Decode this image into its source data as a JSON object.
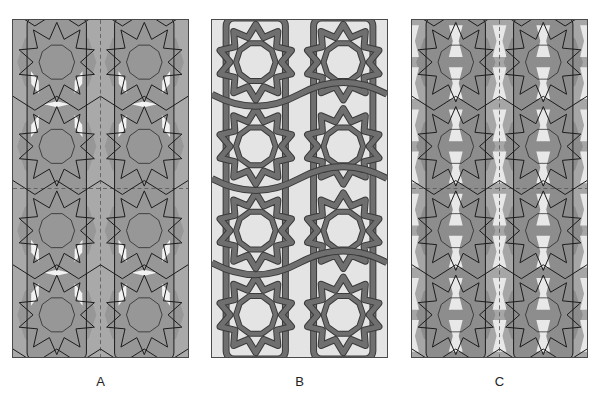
{
  "figure": {
    "panels": [
      {
        "id": "A",
        "label": "A",
        "left": 12,
        "style": "construction-lines",
        "background": "#a9a9a9",
        "cell_fill": "#979797",
        "line_color": "#1a1a1a",
        "highlight_fill": "#f2f2f2",
        "guide_color": "#555555"
      },
      {
        "id": "B",
        "label": "B",
        "left": 211,
        "style": "interlaced-strapwork",
        "background": "#e4e4e4",
        "strap_fill": "#6f6f6f",
        "strap_edge": "#3a3a3a"
      },
      {
        "id": "C",
        "label": "C",
        "left": 411,
        "style": "shaded-regions",
        "background": "#a6a6a6",
        "cell_fill": "#8d8d8d",
        "light_fill": "#e8e8e8",
        "line_color": "#1a1a1a",
        "guide_color": "#555555"
      }
    ],
    "tiling": {
      "columns": 2,
      "rows": 2,
      "rosette_points": 10
    }
  }
}
